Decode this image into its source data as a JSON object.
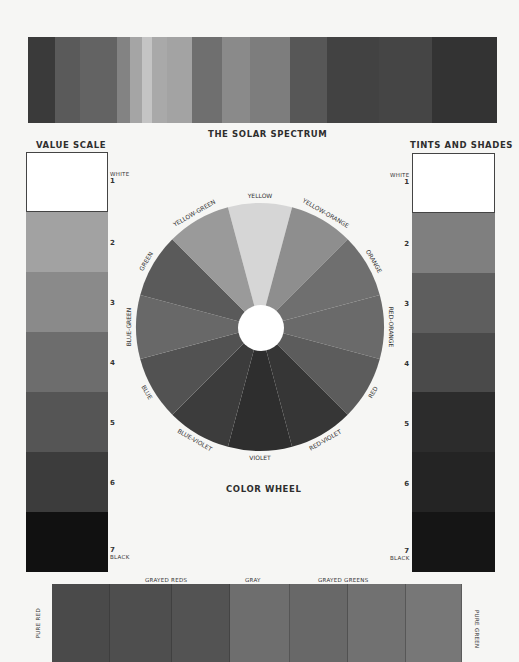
{
  "spectrum": {
    "title": "THE SOLAR SPECTRUM",
    "bands": [
      {
        "width": 27,
        "color": "#3a3a3a"
      },
      {
        "width": 25,
        "color": "#5a5a5a"
      },
      {
        "width": 37,
        "color": "#636363"
      },
      {
        "width": 13,
        "color": "#838383"
      },
      {
        "width": 12,
        "color": "#a5a5a5"
      },
      {
        "width": 10,
        "color": "#c4c4c4"
      },
      {
        "width": 15,
        "color": "#a9a9a9"
      },
      {
        "width": 25,
        "color": "#a3a3a3"
      },
      {
        "width": 30,
        "color": "#6f6f6f"
      },
      {
        "width": 28,
        "color": "#8a8a8a"
      },
      {
        "width": 40,
        "color": "#7d7d7d"
      },
      {
        "width": 37,
        "color": "#575757"
      },
      {
        "width": 52,
        "color": "#424242"
      },
      {
        "width": 53,
        "color": "#454545"
      },
      {
        "width": 65,
        "color": "#333333"
      }
    ]
  },
  "value_scale": {
    "title": "VALUE SCALE",
    "steps": [
      {
        "label": "WHITE",
        "number": "1",
        "color": "#ffffff"
      },
      {
        "label": "",
        "number": "2",
        "color": "#a2a2a2"
      },
      {
        "label": "",
        "number": "3",
        "color": "#8a8a8a"
      },
      {
        "label": "",
        "number": "4",
        "color": "#6d6d6d"
      },
      {
        "label": "",
        "number": "5",
        "color": "#555555"
      },
      {
        "label": "",
        "number": "6",
        "color": "#3c3c3c"
      },
      {
        "label": "BLACK",
        "number": "7",
        "color": "#111111"
      }
    ]
  },
  "tints_shades": {
    "title": "TINTS AND SHADES",
    "steps": [
      {
        "label": "WHITE",
        "number": "1",
        "color": "#ffffff"
      },
      {
        "label": "",
        "number": "2",
        "color": "#7f7f7f"
      },
      {
        "label": "",
        "number": "3",
        "color": "#5e5e5e"
      },
      {
        "label": "",
        "number": "4",
        "color": "#4a4a4a"
      },
      {
        "label": "",
        "number": "5",
        "color": "#2c2c2c"
      },
      {
        "label": "",
        "number": "6",
        "color": "#242424"
      },
      {
        "label": "BLACK",
        "number": "7",
        "color": "#151515"
      }
    ]
  },
  "color_wheel": {
    "title": "COLOR WHEEL",
    "segments": [
      {
        "name": "YELLOW",
        "color": "#d6d6d6"
      },
      {
        "name": "YELLOW-ORANGE",
        "color": "#8e8e8e"
      },
      {
        "name": "ORANGE",
        "color": "#6f6f6f"
      },
      {
        "name": "RED-ORANGE",
        "color": "#6a6a6a"
      },
      {
        "name": "RED",
        "color": "#5c5c5c"
      },
      {
        "name": "RED-VIOLET",
        "color": "#363636"
      },
      {
        "name": "VIOLET",
        "color": "#2e2e2e"
      },
      {
        "name": "BLUE-VIOLET",
        "color": "#3c3c3c"
      },
      {
        "name": "BLUE",
        "color": "#525252"
      },
      {
        "name": "BLUE-GREEN",
        "color": "#686868"
      },
      {
        "name": "GREEN",
        "color": "#5a5a5a"
      },
      {
        "name": "YELLOW-GREEN",
        "color": "#9a9a9a"
      }
    ]
  },
  "grayed_strip": {
    "left_label": "PURE RED",
    "right_label": "PURE GREEN",
    "top_labels": {
      "grayed_reds": "GRAYED REDS",
      "gray": "GRAY",
      "grayed_greens": "GRAYED GREENS"
    },
    "bands": [
      {
        "width": 58,
        "color": "#4a4a4a"
      },
      {
        "width": 62,
        "color": "#4e4e4e"
      },
      {
        "width": 58,
        "color": "#535353"
      },
      {
        "width": 60,
        "color": "#6e6e6e"
      },
      {
        "width": 58,
        "color": "#686868"
      },
      {
        "width": 58,
        "color": "#717171"
      },
      {
        "width": 56,
        "color": "#777777"
      }
    ]
  }
}
